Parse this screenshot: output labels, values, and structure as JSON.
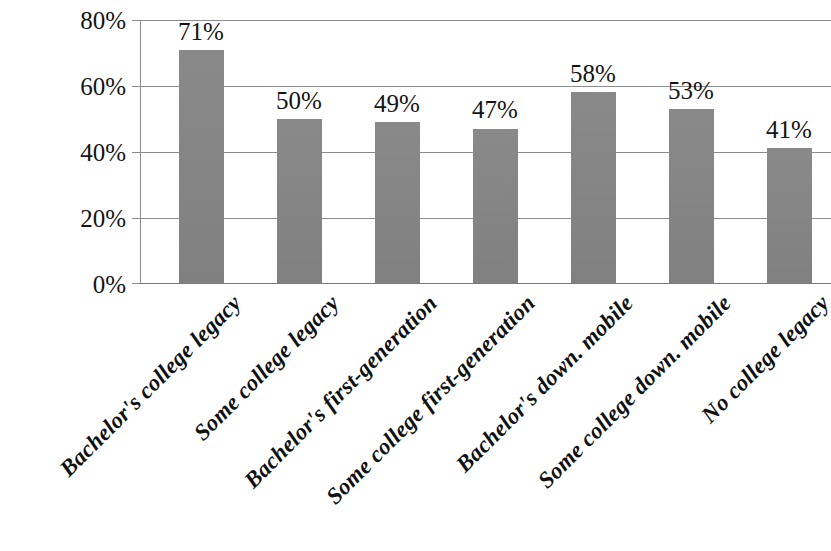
{
  "chart_data": {
    "type": "bar",
    "title": "",
    "subtitle": "",
    "xlabel": "",
    "ylabel": "",
    "ylim": [
      0,
      80
    ],
    "y_ticks": [
      "0%",
      "20%",
      "40%",
      "60%",
      "80%"
    ],
    "y_tick_values": [
      0,
      20,
      40,
      60,
      80
    ],
    "grid": true,
    "legend": false,
    "legend_position": "none",
    "bar_color": "#858585",
    "gridline_color": "#8c8c8c",
    "categories": [
      "Bachelor's college legacy",
      "Some college legacy",
      "Bachelor's first-generation",
      "Some college first-generation",
      "Bachelor's down. mobile",
      "Some college down. mobile",
      "No college legacy"
    ],
    "values": [
      71,
      50,
      49,
      47,
      58,
      53,
      41
    ],
    "data_labels": [
      "71%",
      "50%",
      "49%",
      "47%",
      "58%",
      "53%",
      "41%"
    ]
  },
  "axis": {
    "y_labels": [
      {
        "text": "80%",
        "value": 80
      },
      {
        "text": "60%",
        "value": 60
      },
      {
        "text": "40%",
        "value": 40
      },
      {
        "text": "20%",
        "value": 20
      },
      {
        "text": "0%",
        "value": 0
      }
    ]
  }
}
